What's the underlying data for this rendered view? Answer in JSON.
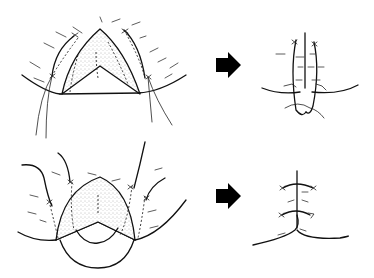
{
  "figure": {
    "colors": {
      "line": "#111111",
      "arrow": "#000000",
      "background": "#ffffff",
      "stipple": "#777777"
    },
    "rows": [
      {
        "id": "top",
        "before": "inverted-V flap with stippled wedge and lateral sutures",
        "arrow": "arrow-right-icon",
        "after": "closed vertical incision with sutures, small loop at base"
      },
      {
        "id": "bottom",
        "before": "rounded triangular flap with stippled area and curved sutures",
        "arrow": "arrow-right-icon",
        "after": "closed Y-shaped incision with two horizontal sutures"
      }
    ]
  }
}
